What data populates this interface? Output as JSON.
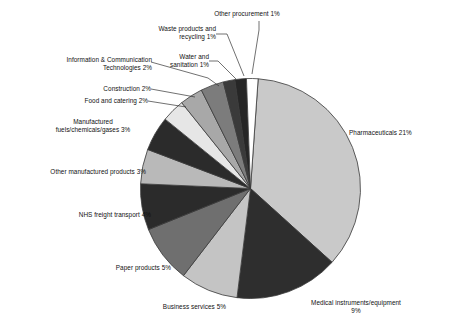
{
  "chart_data": {
    "type": "pie",
    "title": "",
    "subtitle": "",
    "xlabel": "",
    "ylabel": "",
    "legend_position": "none",
    "grid": false,
    "units": "percent",
    "total_labelled_percent": 55,
    "categories": [
      "Pharmaceuticals",
      "Medical instruments/equipment",
      "Business services",
      "Paper products",
      "NHS freight transport",
      "Other manufactured products",
      "Manufactured fuels/chemicals/gases",
      "Food and catering",
      "Construction",
      "Information & Communication Technologies",
      "Water and sanitation",
      "Waste products and recycling",
      "Other procurement"
    ],
    "values": [
      21,
      9,
      5,
      5,
      4,
      3,
      3,
      2,
      2,
      2,
      1,
      1,
      1
    ],
    "slice_colors": [
      "#c9c9c9",
      "#2e2e2e",
      "#c4c4c4",
      "#6f6f6f",
      "#2b2b2b",
      "#b9b9b9",
      "#2b2b2b",
      "#e6e6e6",
      "#a8a8a8",
      "#7c7c7c",
      "#3a3a3a",
      "#262626",
      "#ffffff"
    ],
    "slices": [
      {
        "label": "Pharmaceuticals 21%",
        "name": "Pharmaceuticals",
        "value": 21,
        "color": "#c9c9c9"
      },
      {
        "label": "Medical instruments/equipment\n9%",
        "name": "Medical instruments/equipment",
        "value": 9,
        "color": "#2e2e2e"
      },
      {
        "label": "Business services 5%",
        "name": "Business services",
        "value": 5,
        "color": "#c4c4c4"
      },
      {
        "label": "Paper products 5%",
        "name": "Paper products",
        "value": 5,
        "color": "#6f6f6f"
      },
      {
        "label": "NHS freight transport 4%",
        "name": "NHS freight transport",
        "value": 4,
        "color": "#2b2b2b"
      },
      {
        "label": "Other manufactured products 3%",
        "name": "Other manufactured products",
        "value": 3,
        "color": "#b9b9b9"
      },
      {
        "label": "Manufactured\nfuels/chemicals/gases 3%",
        "name": "Manufactured fuels/chemicals/gases",
        "value": 3,
        "color": "#2b2b2b"
      },
      {
        "label": "Food and catering 2%",
        "name": "Food and catering",
        "value": 2,
        "color": "#e6e6e6"
      },
      {
        "label": "Construction 2%",
        "name": "Construction",
        "value": 2,
        "color": "#a8a8a8"
      },
      {
        "label": "Information & Communication\nTechnologies 2%",
        "name": "Information & Communication Technologies",
        "value": 2,
        "color": "#7c7c7c"
      },
      {
        "label": "Water and\nsanitation 1%",
        "name": "Water and sanitation",
        "value": 1,
        "color": "#3a3a3a"
      },
      {
        "label": "Waste products and\nrecycling 1%",
        "name": "Waste products and recycling",
        "value": 1,
        "color": "#262626"
      },
      {
        "label": "Other procurement 1%",
        "name": "Other procurement",
        "value": 1,
        "color": "#ffffff"
      }
    ]
  },
  "labels": {
    "pharmaceuticals": "Pharmaceuticals 21%",
    "medical_instruments": "Medical instruments/equipment\n9%",
    "business_services": "Business services 5%",
    "paper_products": "Paper products 5%",
    "nhs_freight_transport": "NHS freight transport 4%",
    "other_manufactured_products": "Other manufactured products 3%",
    "manufactured_fuels": "Manufactured\nfuels/chemicals/gases 3%",
    "food_and_catering": "Food and catering 2%",
    "construction": "Construction 2%",
    "ict": "Information & Communication\nTechnologies 2%",
    "water_and_sanitation": "Water and\nsanitation 1%",
    "waste_products": "Waste products and\nrecycling 1%",
    "other_procurement": "Other procurement 1%"
  },
  "style": {
    "outline_color": "#3a3a3a",
    "leader_color": "#333333",
    "background": "#ffffff",
    "text_color": "#111111"
  }
}
